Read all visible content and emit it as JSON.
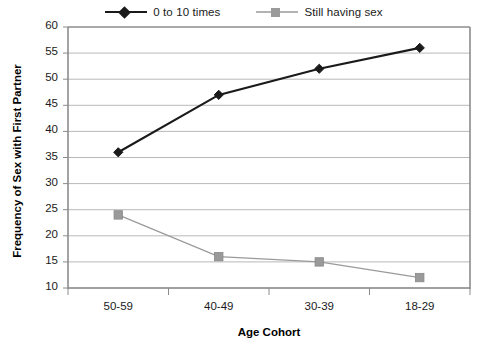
{
  "chart_data": {
    "type": "line",
    "title": "",
    "xlabel": "Age Cohort",
    "ylabel": "Frequency of Sex with First Partner",
    "categories": [
      "50-59",
      "40-49",
      "30-39",
      "18-29"
    ],
    "series": [
      {
        "name": "0 to 10 times",
        "values": [
          36,
          47,
          52,
          56
        ],
        "color": "#1a1a1a",
        "marker": "diamond"
      },
      {
        "name": "Still having sex",
        "values": [
          24,
          16,
          15,
          12
        ],
        "color": "#9a9a9a",
        "marker": "square"
      }
    ],
    "ylim": [
      10,
      60
    ],
    "ytick_step": 5,
    "yticks": [
      "60",
      "55",
      "50",
      "45",
      "40",
      "35",
      "30",
      "25",
      "20",
      "15",
      "10"
    ],
    "grid": "horizontal",
    "legend_position": "top-center"
  },
  "legend": {
    "entries": [
      {
        "label": "0 to 10 times",
        "color": "#1a1a1a",
        "marker": "diamond"
      },
      {
        "label": "Still having sex",
        "color": "#9a9a9a",
        "marker": "square"
      }
    ]
  },
  "axes": {
    "y_title": "Frequency of Sex with First Partner",
    "x_title": "Age Cohort"
  },
  "colors": {
    "series_1": "#1a1a1a",
    "series_2": "#9a9a9a",
    "grid": "#b9b9b9",
    "axis": "#8c8c8c",
    "background": "#ffffff",
    "text": "#1a1a1a"
  }
}
